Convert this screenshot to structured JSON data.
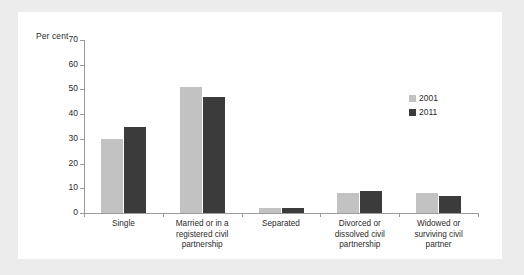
{
  "chart_data": {
    "type": "bar",
    "title": "",
    "subtitle": "",
    "xlabel": "",
    "ylabel": "Per cent",
    "ylim": [
      0,
      70
    ],
    "yticks": [
      0,
      10,
      20,
      30,
      40,
      50,
      60,
      70
    ],
    "grid": false,
    "legend_position": "right",
    "categories": [
      "Single",
      "Married or in a\nregistered civil\npartnership",
      "Separated",
      "Divorced or\ndissolved civil\npartnership",
      "Widowed or\nsurviving civil\npartner"
    ],
    "series": [
      {
        "name": "2001",
        "color": "#c2c2c2",
        "values": [
          30,
          51,
          2,
          8,
          8
        ]
      },
      {
        "name": "2011",
        "color": "#3b3b3b",
        "values": [
          35,
          47,
          2,
          9,
          7
        ]
      }
    ]
  },
  "legend": {
    "items": [
      {
        "label": "2001",
        "color": "#c2c2c2"
      },
      {
        "label": "2011",
        "color": "#3b3b3b"
      }
    ]
  },
  "axis": {
    "y_caption": "Per cent",
    "y_tick_labels": [
      "70",
      "60",
      "50",
      "40",
      "30",
      "20",
      "10",
      "0"
    ]
  },
  "colors": {
    "series_2001": "#c2c2c2",
    "series_2011": "#3b3b3b",
    "axis_line": "#9a9a9a",
    "panel_background": "#ffffff",
    "page_background": "#ececed",
    "text": "#2b2b2b"
  }
}
